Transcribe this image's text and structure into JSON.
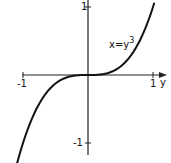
{
  "chart_data": {
    "type": "line",
    "title": "",
    "xlabel": "y",
    "ylabel": "",
    "x_ticks": [
      "-1",
      "1"
    ],
    "y_ticks": [
      "1",
      "-1"
    ],
    "xlim": [
      -1.05,
      1.2
    ],
    "ylim": [
      -1.2,
      1.1
    ],
    "grid": false,
    "legend": null,
    "series": [
      {
        "name": "x=y^3",
        "label_text": "x=y",
        "label_exponent": "3",
        "x": [
          -1.1,
          -1.0,
          -0.8,
          -0.6,
          -0.4,
          -0.2,
          0.0,
          0.2,
          0.4,
          0.6,
          0.8,
          1.0,
          1.03
        ],
        "values": [
          -1.331,
          -1.0,
          -0.512,
          -0.216,
          -0.064,
          -0.008,
          0.0,
          0.008,
          0.064,
          0.216,
          0.512,
          1.0,
          1.093
        ]
      }
    ],
    "colors": {
      "axis": "#222222",
      "curve": "#111111"
    }
  }
}
